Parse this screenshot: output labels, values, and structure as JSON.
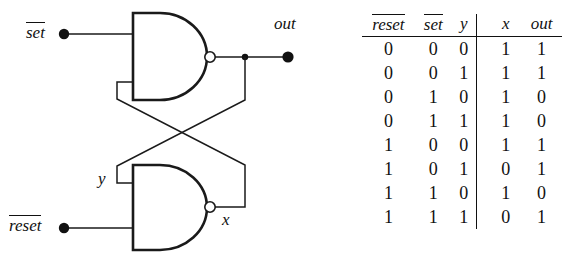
{
  "figure": {
    "type": "nand-latch-circuit-with-truth-table"
  },
  "circuit": {
    "title": "Cross-coupled NAND latch",
    "labels": {
      "set": "set",
      "set_overbar": true,
      "reset": "reset",
      "reset_overbar": true,
      "out": "out",
      "y": "y",
      "x": "x"
    },
    "gates": [
      {
        "name": "upper-nand-gate",
        "type": "NAND",
        "inputs": [
          "set",
          "x"
        ],
        "output": "out"
      },
      {
        "name": "lower-nand-gate",
        "type": "NAND",
        "inputs": [
          "y",
          "reset"
        ],
        "output": "x"
      }
    ],
    "nodes": [
      {
        "name": "set-terminal",
        "kind": "filled-dot"
      },
      {
        "name": "reset-terminal",
        "kind": "filled-dot"
      },
      {
        "name": "out-terminal",
        "kind": "filled-dot"
      },
      {
        "name": "out-junction",
        "kind": "junction-dot"
      }
    ],
    "colors": {
      "wire": "#1a1a1a",
      "background": "#ffffff"
    }
  },
  "truth_table": {
    "headers": {
      "reset": "reset",
      "reset_overbar": true,
      "set": "set",
      "set_overbar": true,
      "y": "y",
      "x": "x",
      "out": "out"
    },
    "rows": [
      {
        "reset": "0",
        "set": "0",
        "y": "0",
        "x": "1",
        "out": "1"
      },
      {
        "reset": "0",
        "set": "0",
        "y": "1",
        "x": "1",
        "out": "1"
      },
      {
        "reset": "0",
        "set": "1",
        "y": "0",
        "x": "1",
        "out": "0"
      },
      {
        "reset": "0",
        "set": "1",
        "y": "1",
        "x": "1",
        "out": "0"
      },
      {
        "reset": "1",
        "set": "0",
        "y": "0",
        "x": "1",
        "out": "1"
      },
      {
        "reset": "1",
        "set": "0",
        "y": "1",
        "x": "0",
        "out": "1"
      },
      {
        "reset": "1",
        "set": "1",
        "y": "0",
        "x": "1",
        "out": "0"
      },
      {
        "reset": "1",
        "set": "1",
        "y": "1",
        "x": "0",
        "out": "1"
      }
    ]
  }
}
